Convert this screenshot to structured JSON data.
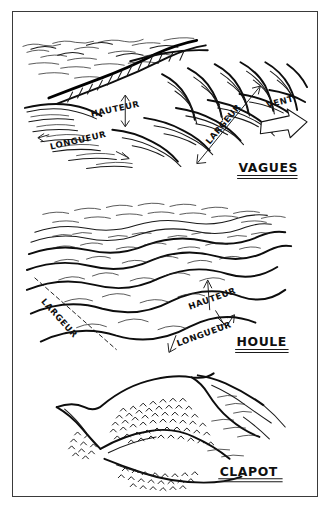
{
  "document": {
    "kind": "hand-drawn-diagram",
    "subject": "Types de vagues / états de la mer",
    "language": "fr",
    "ink_color": "#111111",
    "paper_color": "#ffffff",
    "frame_color": "#3a3a3a"
  },
  "panels": [
    {
      "id": "vagues",
      "caption": "VAGUES",
      "caption_underlined": true,
      "labels": [
        {
          "id": "hauteur",
          "text": "HAUTEUR",
          "annotation": "double-arrow-vertical"
        },
        {
          "id": "longueur",
          "text": "LONGUEUR",
          "annotation": "double-arrow-horizontal"
        },
        {
          "id": "largeur",
          "text": "LARGEUR",
          "annotation": "double-arrow-diagonal"
        },
        {
          "id": "vent",
          "text": "VENT",
          "annotation": "hollow-block-arrow"
        }
      ]
    },
    {
      "id": "houle",
      "caption": "HOULE",
      "caption_underlined": true,
      "labels": [
        {
          "id": "largeur",
          "text": "LARGEUR",
          "annotation": "dashed-diagonal-line"
        },
        {
          "id": "hauteur",
          "text": "HAUTEUR",
          "annotation": "leader-arrow"
        },
        {
          "id": "longueur",
          "text": "LONGUEUR",
          "annotation": "leader-arrow"
        }
      ]
    },
    {
      "id": "clapot",
      "caption": "CLAPOT",
      "caption_underlined": true,
      "labels": []
    }
  ],
  "icons": {
    "wind_arrow": "block-arrow-icon",
    "measure_arrow": "double-headed-arrow-icon"
  }
}
